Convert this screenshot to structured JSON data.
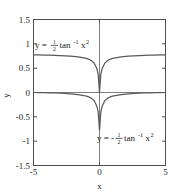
{
  "chart_data": {
    "type": "line",
    "title": "",
    "xlabel": "x",
    "ylabel": "y",
    "xlim": [
      -5,
      5
    ],
    "ylim": [
      -1.5,
      1.5
    ],
    "xticks": [
      "-5",
      "0",
      "5"
    ],
    "xtick_values": [
      -5,
      0,
      5
    ],
    "yticks": [
      "1.5",
      "1",
      "0.5",
      "0",
      "-0.5",
      "-1",
      "-1.5"
    ],
    "ytick_values": [
      1.5,
      1,
      0.5,
      0,
      -0.5,
      -1,
      -1.5
    ],
    "grid": false,
    "legend": "none",
    "axis_lines": {
      "x_axis_at_y": 0,
      "y_axis_at_x": 0
    },
    "series": [
      {
        "name": "y = 1/2 tan^-1 x^2",
        "color": "#595959",
        "x": [
          -5,
          -4.6,
          -4.2,
          -3.8,
          -3.4,
          -3.0,
          -2.6,
          -2.2,
          -1.8,
          -1.5,
          -1.2,
          -1.0,
          -0.8,
          -0.6,
          -0.4,
          -0.2,
          -0.1,
          0,
          0.1,
          0.2,
          0.4,
          0.6,
          0.8,
          1.0,
          1.2,
          1.5,
          1.8,
          2.2,
          2.6,
          3.0,
          3.4,
          3.8,
          4.2,
          4.6,
          5
        ],
        "values": [
          0.7738,
          0.7719,
          0.7696,
          0.7669,
          0.7635,
          0.7592,
          0.7538,
          0.7466,
          0.7365,
          0.7263,
          0.712,
          0.7,
          0.6823,
          0.6539,
          0.6031,
          0.492,
          0.3742,
          0.0,
          0.3742,
          0.492,
          0.6031,
          0.6539,
          0.6823,
          0.7,
          0.712,
          0.7263,
          0.7365,
          0.7466,
          0.7538,
          0.7592,
          0.7635,
          0.7669,
          0.7696,
          0.7719,
          0.7738
        ]
      },
      {
        "name": "y = -1/2 tan^-1 x^2",
        "color": "#595959",
        "x": [
          -5,
          -4.6,
          -4.2,
          -3.8,
          -3.4,
          -3.0,
          -2.6,
          -2.2,
          -1.8,
          -1.5,
          -1.2,
          -1.0,
          -0.8,
          -0.6,
          -0.4,
          -0.2,
          -0.1,
          0,
          0.1,
          0.2,
          0.4,
          0.6,
          0.8,
          1.0,
          1.2,
          1.5,
          1.8,
          2.2,
          2.6,
          3.0,
          3.4,
          3.8,
          4.2,
          4.6,
          5
        ],
        "values": [
          0.0,
          -0.0019,
          -0.0042,
          -0.0069,
          -0.0103,
          -0.0146,
          -0.02,
          -0.0272,
          -0.0373,
          -0.0475,
          -0.0618,
          -0.0738,
          -0.0915,
          -0.1199,
          -0.1707,
          -0.2818,
          -0.3996,
          -0.7738,
          -0.3996,
          -0.2818,
          -0.1707,
          -0.1199,
          -0.0915,
          -0.0738,
          -0.0618,
          -0.0475,
          -0.0373,
          -0.0272,
          -0.02,
          -0.0146,
          -0.0103,
          -0.0069,
          -0.0042,
          -0.0019,
          0.0
        ]
      }
    ],
    "annotations": [
      {
        "id": "upper-label",
        "text": "y = 1/2 tan^-1 x^2",
        "parts": {
          "lhs": "y =",
          "frac_num": "1",
          "frac_den": "2",
          "fn": "tan",
          "fn_sup": "-1",
          "arg": "x",
          "arg_sup": "2"
        },
        "x": 35,
        "y": 48
      },
      {
        "id": "lower-label",
        "text": "y = -1/2 tan^-1 x^2",
        "parts": {
          "lhs": "y = -",
          "frac_num": "1",
          "frac_den": "2",
          "fn": "tan",
          "fn_sup": "-1",
          "arg": "x",
          "arg_sup": "2"
        },
        "x": 97,
        "y": 141
      }
    ]
  },
  "colors": {
    "curve": "#595959",
    "frame": "#4d4d4d",
    "axis": "#808080",
    "background": "#ffffff",
    "text": "#1a1a1a"
  }
}
